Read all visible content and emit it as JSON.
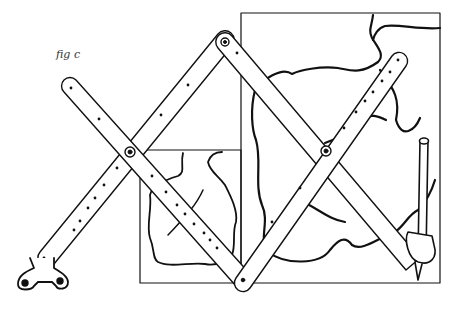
{
  "figure": {
    "caption": "fig c",
    "colors": {
      "ink": "#111111",
      "paper": "#ffffff"
    }
  },
  "parts": {
    "small_frame": {
      "label": "original-drawing-frame"
    },
    "large_frame": {
      "label": "enlarged-drawing-frame"
    },
    "anchor": {
      "label": "anchor-bracket"
    },
    "stylus": {
      "label": "pencil-holder"
    }
  }
}
